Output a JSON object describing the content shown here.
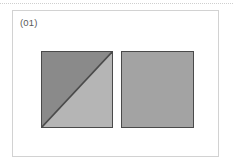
{
  "canvas": {
    "width": 233,
    "height": 167,
    "background": "#ffffff"
  },
  "top_rule": {
    "style": "dotted",
    "color": "#cfcfcf"
  },
  "panel": {
    "border_color": "#d2d2d2",
    "background": "#ffffff",
    "label": "(01)",
    "label_color": "#5a5a5a"
  },
  "figure": {
    "caption": "(01)",
    "shape_count": 2,
    "shapes": [
      {
        "id": "left-square",
        "name": "square-split-diagonal",
        "type": "square",
        "subdivision": "diagonal",
        "diagonal_direction": "bottom-left-to-top-right",
        "diagonal_color": "#4a4a4a",
        "outline_color": "#4a4a4a",
        "regions": [
          {
            "name": "upper-left-triangle",
            "fill": "#8a8a8a",
            "points": "0,0 100,0 0,100"
          },
          {
            "name": "lower-right-triangle",
            "fill": "#b5b5b5",
            "points": "100,0 100,100 0,100"
          }
        ]
      },
      {
        "id": "right-square",
        "name": "square-solid",
        "type": "square",
        "subdivision": "none",
        "fill": "#a3a3a3",
        "outline_color": "#4a4a4a"
      }
    ]
  }
}
